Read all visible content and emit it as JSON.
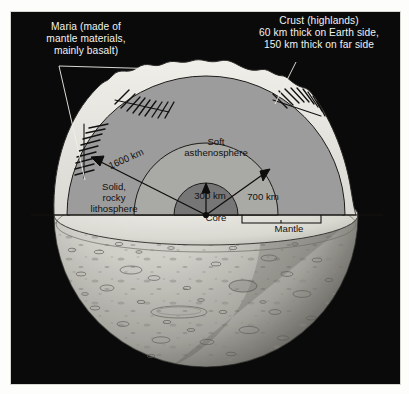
{
  "figure": {
    "background_color": "#0a0a0a",
    "frame_color": "#d8d8d2"
  },
  "callouts": [
    {
      "id": "maria",
      "text": "Maria (made of\nmantle materials,\nmainly basalt)",
      "color": "#f2f2ef",
      "position": "top-left",
      "leader_lines": 2
    },
    {
      "id": "crust",
      "text": "Crust (highlands)\n60 km thick on Earth side,\n150 km thick on far side",
      "color": "#f2f2ef",
      "position": "top-right",
      "leader_lines": 1
    }
  ],
  "layers": [
    {
      "id": "crust",
      "name": "Crust (highlands)",
      "thickness_earth_side_km": 60,
      "thickness_far_side_km": 150,
      "fill": "#e8e7e2"
    },
    {
      "id": "lithosphere",
      "name": "Solid,\nrocky\nlithosphere",
      "radius_km": 1600,
      "fill": "#9c9c9c"
    },
    {
      "id": "asthenosphere",
      "name": "Soft\nasthenosphere",
      "radius_km": 700,
      "fill": "#a8a8a6"
    },
    {
      "id": "core",
      "name": "Core",
      "radius_km": 300,
      "fill": "#767676"
    },
    {
      "id": "mantle",
      "name": "Mantle",
      "fill": "#9c9c9c"
    }
  ],
  "dimension_arrows": [
    {
      "id": "r-lithosphere",
      "label": "1600 km",
      "value_km": 1600,
      "direction": "up-left"
    },
    {
      "id": "r-asthenosphere",
      "label": "700 km",
      "value_km": 700,
      "direction": "up-right"
    },
    {
      "id": "r-core",
      "label": "300 km",
      "value_km": 300,
      "direction": "up"
    }
  ],
  "brackets": [
    {
      "id": "mantle-bracket",
      "label": "Mantle"
    }
  ],
  "surface": {
    "description": "Cratered lower hemisphere of the Moon",
    "highlight": "#f0efe9",
    "shadow": "#6d6c68",
    "crater_count": 96
  },
  "hatch_patches": [
    {
      "id": "maria-patch-left",
      "marks": 9
    },
    {
      "id": "maria-patch-upper",
      "marks": 10
    },
    {
      "id": "maria-patch-right",
      "marks": 9
    }
  ]
}
